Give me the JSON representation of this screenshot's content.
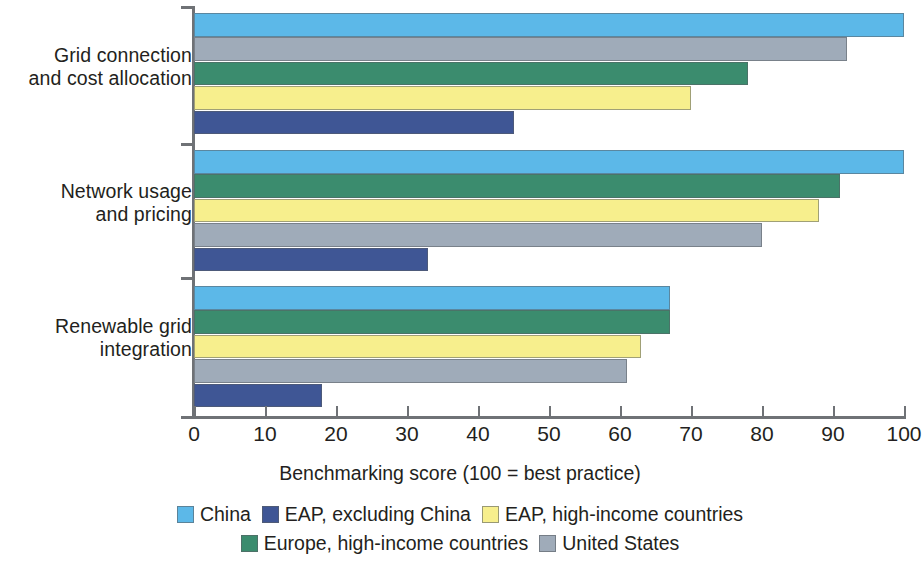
{
  "chart_data": {
    "type": "bar",
    "orientation": "horizontal",
    "title": "",
    "xlabel": "Benchmarking score (100 = best practice)",
    "ylabel": "",
    "xlim": [
      0,
      100
    ],
    "xticks": [
      0,
      10,
      20,
      30,
      40,
      50,
      60,
      70,
      80,
      90,
      100
    ],
    "grid": false,
    "legend_position": "bottom",
    "categories": [
      "Grid connection and cost allocation",
      "Network usage and pricing",
      "Renewable grid integration"
    ],
    "category_lines": [
      [
        "Grid connection",
        "and cost allocation"
      ],
      [
        "Network usage",
        "and pricing"
      ],
      [
        "Renewable grid",
        "integration"
      ]
    ],
    "series": [
      {
        "name": "China",
        "color": "#5cb8e8",
        "values": [
          100,
          100,
          67
        ]
      },
      {
        "name": "EAP, excluding China",
        "color": "#3f5695",
        "values": [
          45,
          33,
          18
        ]
      },
      {
        "name": "EAP, high-income countries",
        "color": "#f7ef8d",
        "values": [
          70,
          88,
          63
        ]
      },
      {
        "name": "Europe, high-income countries",
        "color": "#3b8c6e",
        "values": [
          78,
          91,
          67
        ]
      },
      {
        "name": "United States",
        "color": "#9fabb9",
        "values": [
          92,
          80,
          61
        ]
      }
    ],
    "bar_order": [
      [
        "China",
        "United States",
        "Europe, high-income countries",
        "EAP, high-income countries",
        "EAP, excluding China"
      ],
      [
        "China",
        "Europe, high-income countries",
        "EAP, high-income countries",
        "United States",
        "EAP, excluding China"
      ],
      [
        "China",
        "Europe, high-income countries",
        "EAP, high-income countries",
        "United States",
        "EAP, excluding China"
      ]
    ]
  },
  "axis": {
    "x_title": "Benchmarking score (100 = best practice)",
    "tick_labels": [
      "0",
      "10",
      "20",
      "30",
      "40",
      "50",
      "60",
      "70",
      "80",
      "90",
      "100"
    ]
  },
  "legend": {
    "row1": [
      {
        "label": "China",
        "color": "#5cb8e8"
      },
      {
        "label": "EAP, excluding China",
        "color": "#3f5695"
      },
      {
        "label": "EAP, high-income countries",
        "color": "#f7ef8d"
      }
    ],
    "row2": [
      {
        "label": "Europe, high-income countries",
        "color": "#3b8c6e"
      },
      {
        "label": "United States",
        "color": "#9fabb9"
      }
    ]
  }
}
